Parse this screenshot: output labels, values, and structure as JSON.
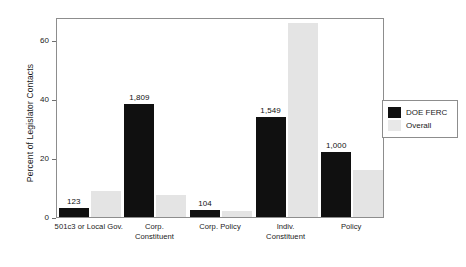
{
  "chart_data": {
    "type": "bar",
    "title": "",
    "xlabel": "",
    "ylabel": "Percent of Legislator Contacts",
    "ylim": [
      0,
      68
    ],
    "yticks": [
      0,
      20,
      40,
      60
    ],
    "ytick_labels": [
      "0",
      "20",
      "40",
      "60"
    ],
    "grid": false,
    "legend_position": "right-outside",
    "categories": [
      "501c3 or Local Gov.",
      "Corp. Constituent",
      "Corp. Policy",
      "Indiv. Constituent",
      "Policy"
    ],
    "category_lines": [
      [
        "501c3 or Local Gov."
      ],
      [
        "Corp.",
        "Constituent"
      ],
      [
        "Corp. Policy"
      ],
      [
        "Indiv.",
        "Constituent"
      ],
      [
        "Policy"
      ]
    ],
    "series": [
      {
        "name": "DOE FERC",
        "color": "#101010",
        "values": [
          3.0,
          38.5,
          2.5,
          34.0,
          22.0
        ],
        "data_labels": [
          "123",
          "1,809",
          "104",
          "1,549",
          "1,000"
        ]
      },
      {
        "name": "Overall",
        "color": "#e4e4e4",
        "values": [
          9.0,
          7.5,
          2.0,
          66.0,
          16.0
        ],
        "data_labels": [
          "",
          "",
          "",
          "",
          ""
        ]
      }
    ]
  },
  "legend": {
    "entries": [
      {
        "label": "DOE FERC",
        "color": "#101010"
      },
      {
        "label": "Overall",
        "color": "#e8e8e8"
      }
    ]
  }
}
